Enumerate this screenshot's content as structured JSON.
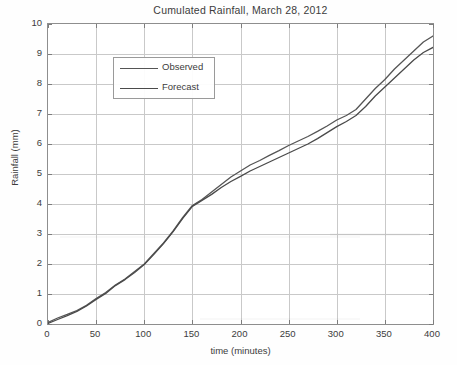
{
  "chart_data": {
    "type": "line",
    "title": "Cumulated Rainfall, March 28, 2012",
    "xlabel": "time (minutes)",
    "ylabel": "Rainfall (mm)",
    "xlim": [
      0,
      400
    ],
    "ylim": [
      0,
      10
    ],
    "xticks": [
      0,
      50,
      100,
      150,
      200,
      250,
      300,
      350,
      400
    ],
    "yticks": [
      0,
      1,
      2,
      3,
      4,
      5,
      6,
      7,
      8,
      9,
      10
    ],
    "grid": true,
    "legend_position": "upper left",
    "series": [
      {
        "name": "Observed",
        "color": "#555555",
        "x": [
          0,
          10,
          20,
          30,
          40,
          50,
          60,
          70,
          80,
          90,
          100,
          110,
          120,
          130,
          140,
          150,
          160,
          170,
          180,
          190,
          200,
          210,
          220,
          230,
          240,
          250,
          260,
          270,
          280,
          290,
          300,
          310,
          320,
          330,
          340,
          350,
          360,
          370,
          380,
          390,
          400
        ],
        "y": [
          0.05,
          0.2,
          0.32,
          0.45,
          0.62,
          0.85,
          1.05,
          1.3,
          1.5,
          1.75,
          2.0,
          2.35,
          2.7,
          3.1,
          3.55,
          3.95,
          4.15,
          4.4,
          4.65,
          4.9,
          5.1,
          5.3,
          5.45,
          5.62,
          5.78,
          5.95,
          6.1,
          6.25,
          6.42,
          6.6,
          6.8,
          6.95,
          7.15,
          7.5,
          7.85,
          8.15,
          8.5,
          8.8,
          9.1,
          9.4,
          9.6
        ]
      },
      {
        "name": "Forecast",
        "color": "#4a4a4a",
        "x": [
          0,
          10,
          20,
          30,
          40,
          50,
          60,
          70,
          80,
          90,
          100,
          110,
          120,
          130,
          140,
          150,
          160,
          170,
          180,
          190,
          200,
          210,
          220,
          230,
          240,
          250,
          260,
          270,
          280,
          290,
          300,
          310,
          320,
          330,
          340,
          350,
          360,
          370,
          380,
          390,
          400
        ],
        "y": [
          0.02,
          0.15,
          0.28,
          0.42,
          0.6,
          0.82,
          1.02,
          1.28,
          1.48,
          1.72,
          1.98,
          2.32,
          2.68,
          3.08,
          3.52,
          3.92,
          4.12,
          4.32,
          4.55,
          4.75,
          4.92,
          5.1,
          5.25,
          5.4,
          5.55,
          5.7,
          5.85,
          6.0,
          6.18,
          6.38,
          6.58,
          6.75,
          6.95,
          7.25,
          7.6,
          7.9,
          8.2,
          8.5,
          8.8,
          9.05,
          9.22
        ]
      }
    ]
  },
  "legend": {
    "items": [
      {
        "label": "Observed"
      },
      {
        "label": "Forecast"
      }
    ]
  },
  "colors": {
    "axis": "#8e8e8e",
    "grid": "#c9c9c9",
    "text": "#3c3c3c",
    "observed": "#555555",
    "forecast": "#4a4a4a",
    "background": "#ffffff"
  }
}
